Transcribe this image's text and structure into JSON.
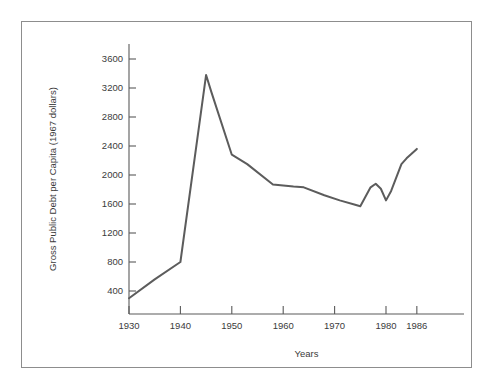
{
  "figure": {
    "frame_color": "#8d8d8d",
    "background": "#ffffff"
  },
  "chart_data": {
    "type": "line",
    "title": "",
    "xlabel": "Years",
    "ylabel": "Gross Public Debt per Capita (1967 dollars)",
    "xlim": [
      1930,
      1990
    ],
    "ylim": [
      0,
      3800
    ],
    "xticks": [
      1930,
      1940,
      1950,
      1960,
      1970,
      1980,
      1986
    ],
    "xtick_labels": [
      "1930",
      "1940",
      "1950",
      "1960",
      "1970",
      "1980",
      "1986"
    ],
    "yticks": [
      400,
      800,
      1200,
      1600,
      2000,
      2400,
      2800,
      3200,
      3600
    ],
    "ytick_labels": [
      "400",
      "800",
      "1200",
      "1600",
      "2000",
      "2400",
      "2800",
      "3200",
      "3600"
    ],
    "grid": false,
    "legend": null,
    "line_color": "#5c5c5c",
    "series": [
      {
        "name": "Gross Public Debt per Capita",
        "x": [
          1930,
          1935,
          1940,
          1945,
          1946,
          1950,
          1953,
          1958,
          1962,
          1964,
          1968,
          1971,
          1974,
          1975,
          1977,
          1978,
          1979,
          1980,
          1981,
          1983,
          1984,
          1986
        ],
        "values": [
          300,
          560,
          800,
          3380,
          3150,
          2280,
          2150,
          1870,
          1840,
          1830,
          1720,
          1650,
          1590,
          1570,
          1830,
          1880,
          1810,
          1650,
          1780,
          2150,
          2230,
          2360
        ]
      }
    ]
  },
  "axis_titles": {
    "x": "Years",
    "y": "Gross Public Debt per Capita (1967 dollars)"
  }
}
